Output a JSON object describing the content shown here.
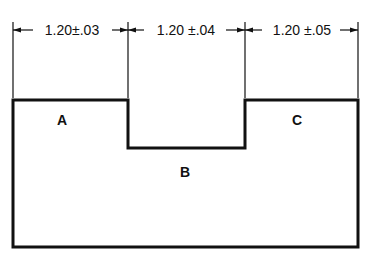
{
  "diagram": {
    "type": "dimensioned-part-drawing",
    "dimensions": [
      {
        "id": "A",
        "text": "1.20±.03",
        "nominal": 1.2,
        "tolerance": 0.03
      },
      {
        "id": "B",
        "text": "1.20 ±.04",
        "nominal": 1.2,
        "tolerance": 0.04
      },
      {
        "id": "C",
        "text": "1.20 ±.05",
        "nominal": 1.2,
        "tolerance": 0.05
      }
    ],
    "labels": {
      "a": "A",
      "b": "B",
      "c": "C"
    },
    "colors": {
      "line": "#111111",
      "background": "#ffffff"
    }
  }
}
